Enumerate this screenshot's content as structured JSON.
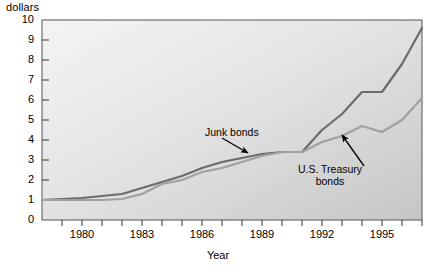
{
  "chart_data": {
    "type": "line",
    "title": "",
    "unit_label": "dollars",
    "xlabel": "Year",
    "ylabel": "",
    "xlim": [
      1978,
      1997
    ],
    "ylim": [
      0,
      10
    ],
    "xticks": [
      1978,
      1979,
      1980,
      1981,
      1982,
      1983,
      1984,
      1985,
      1986,
      1987,
      1988,
      1989,
      1990,
      1991,
      1992,
      1993,
      1994,
      1995,
      1996,
      1997
    ],
    "xtick_labels": [
      "",
      "",
      "1980",
      "",
      "",
      "1983",
      "",
      "",
      "1986",
      "",
      "",
      "1989",
      "",
      "",
      "1992",
      "",
      "",
      "1995",
      "",
      ""
    ],
    "yticks": [
      0,
      1,
      2,
      3,
      4,
      5,
      6,
      7,
      8,
      9,
      10
    ],
    "ytick_labels": [
      "0",
      "1",
      "2",
      "3",
      "4",
      "5",
      "6",
      "7",
      "8",
      "9",
      "10"
    ],
    "grid": false,
    "legend": "annotations",
    "x": [
      1978,
      1979,
      1980,
      1981,
      1982,
      1983,
      1984,
      1985,
      1986,
      1987,
      1988,
      1989,
      1990,
      1991,
      1992,
      1993,
      1994,
      1995,
      1996,
      1997
    ],
    "series": [
      {
        "name": "Junk bonds",
        "color": "#6b6b6b",
        "values": [
          1.0,
          1.05,
          1.1,
          1.2,
          1.3,
          1.6,
          1.9,
          2.2,
          2.6,
          2.9,
          3.1,
          3.3,
          3.4,
          3.4,
          4.5,
          5.3,
          6.4,
          6.4,
          7.8,
          9.6
        ]
      },
      {
        "name": "U.S. Treasury bonds",
        "color": "#a0a0a0",
        "values": [
          1.0,
          1.0,
          1.0,
          1.0,
          1.05,
          1.3,
          1.8,
          2.0,
          2.4,
          2.6,
          2.9,
          3.2,
          3.4,
          3.4,
          3.9,
          4.2,
          4.7,
          4.4,
          5.0,
          6.1
        ]
      }
    ],
    "annotations": [
      {
        "text": "Junk bonds",
        "target_series": "Junk bonds",
        "arrow_from": [
          1987.0,
          4.1
        ],
        "arrow_to": [
          1988.3,
          3.35
        ]
      },
      {
        "text": "U.S. Treasury bonds",
        "target_series": "U.S. Treasury bonds",
        "arrow_from": [
          1994.1,
          2.7
        ],
        "arrow_to": [
          1993.0,
          4.25
        ]
      }
    ],
    "colors": {
      "junk_bonds": "#6b6b6b",
      "treasury_bonds": "#a0a0a0",
      "plot_bg_top_left": "#f2f2f2",
      "plot_bg_bottom_right": "#c9c9c9",
      "axis": "#333333",
      "text": "#000000"
    }
  }
}
